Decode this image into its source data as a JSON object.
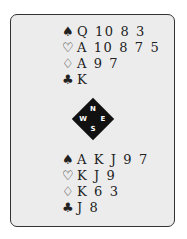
{
  "north": {
    "spades": {
      "symbol": "♠",
      "cards": "Q 10 8 3"
    },
    "hearts": {
      "symbol": "♡",
      "cards": "A 10 8 7 5"
    },
    "diamonds": {
      "symbol": "♢",
      "cards": "A 9 7"
    },
    "clubs": {
      "symbol": "♣",
      "cards": "K"
    }
  },
  "compass": {
    "n": "N",
    "s": "S",
    "w": "W",
    "e": "E"
  },
  "south": {
    "spades": {
      "symbol": "♠",
      "cards": "A K J 9 7"
    },
    "hearts": {
      "symbol": "♡",
      "cards": "K J 9"
    },
    "diamonds": {
      "symbol": "♢",
      "cards": "K 6 3"
    },
    "clubs": {
      "symbol": "♣",
      "cards": "J 8"
    }
  }
}
